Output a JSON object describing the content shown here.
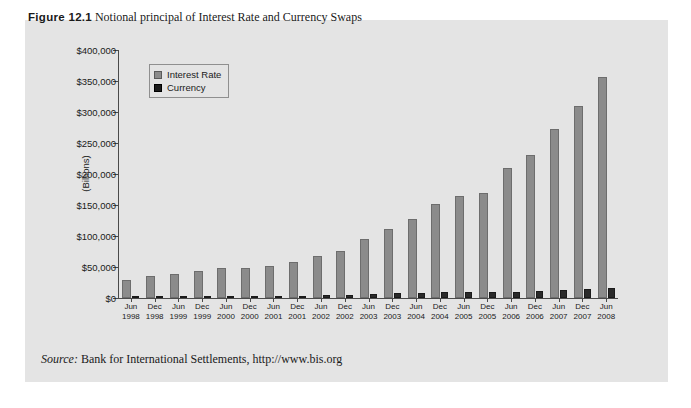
{
  "caption": {
    "figure_label": "Figure 12.1",
    "text": "Notional principal of Interest Rate and Currency Swaps"
  },
  "source": {
    "label": "Source:",
    "text": "Bank for International Settlements, http://www.bis.org"
  },
  "colors": {
    "interest_rate": "#8b8b8b",
    "currency": "#2a2a2a",
    "figure_background": "#e4e4e4",
    "axis": "#4a4a4a"
  },
  "chart_data": {
    "type": "bar",
    "title": "Notional principal of Interest Rate and Currency Swaps",
    "xlabel": "",
    "ylabel": "(Billions)",
    "ylim": [
      0,
      400000
    ],
    "ytick_values": [
      0,
      50000,
      100000,
      150000,
      200000,
      250000,
      300000,
      350000,
      400000
    ],
    "ytick_labels": [
      "$0",
      "$50,000",
      "$100,000",
      "$150,000",
      "$200,000",
      "$250,000",
      "$300,000",
      "$350,000",
      "$400,000"
    ],
    "grid": false,
    "legend_position": "top-left inside plot",
    "categories": [
      "Jun\n1998",
      "Dec\n1998",
      "Jun\n1999",
      "Dec\n1999",
      "Jun\n2000",
      "Dec\n2000",
      "Jun\n2001",
      "Dec\n2001",
      "Jun\n2002",
      "Dec\n2002",
      "Jun\n2003",
      "Dec\n2003",
      "Jun\n2004",
      "Dec\n2004",
      "Jun\n2005",
      "Dec\n2005",
      "Jun\n2006",
      "Dec\n2006",
      "Jun\n2007",
      "Dec\n2007",
      "Jun\n2008"
    ],
    "category_months": [
      "Jun",
      "Dec",
      "Jun",
      "Dec",
      "Jun",
      "Dec",
      "Jun",
      "Dec",
      "Jun",
      "Dec",
      "Jun",
      "Dec",
      "Jun",
      "Dec",
      "Jun",
      "Dec",
      "Jun",
      "Dec",
      "Jun",
      "Dec",
      "Jun"
    ],
    "category_years": [
      "1998",
      "1998",
      "1999",
      "1999",
      "2000",
      "2000",
      "2001",
      "2001",
      "2002",
      "2002",
      "2003",
      "2003",
      "2004",
      "2004",
      "2005",
      "2005",
      "2006",
      "2006",
      "2007",
      "2007",
      "2008"
    ],
    "series": [
      {
        "name": "Interest Rate",
        "color": "#8b8b8b",
        "values": [
          29000,
          36000,
          38000,
          44000,
          48000,
          49000,
          52000,
          58000,
          68000,
          76000,
          95000,
          112000,
          128000,
          151000,
          165000,
          170000,
          210000,
          230000,
          272000,
          310000,
          357000
        ]
      },
      {
        "name": "Currency",
        "color": "#2a2a2a",
        "values": [
          2000,
          2200,
          2300,
          2400,
          2600,
          2700,
          3000,
          3500,
          4500,
          5000,
          6500,
          7500,
          8000,
          9000,
          9000,
          9500,
          10000,
          11000,
          13000,
          15000,
          16000
        ]
      }
    ],
    "legend": [
      "Interest Rate",
      "Currency"
    ]
  }
}
